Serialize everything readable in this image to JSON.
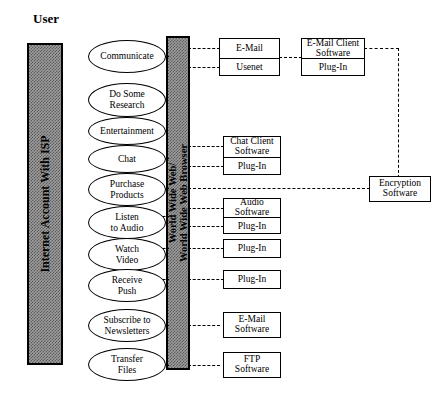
{
  "diagram": {
    "title": "User",
    "bars": [
      {
        "name": "internet-account-bar",
        "label": "Internet Account With ISP"
      },
      {
        "name": "www-browser-bar",
        "label_line1": "World Wide Web/",
        "label_line2": "World Wide Web Browser"
      }
    ],
    "activities": [
      {
        "id": "communicate",
        "label": "Communicate"
      },
      {
        "id": "do-some-research",
        "label": "Do Some\nResearch"
      },
      {
        "id": "entertainment",
        "label": "Entertainment"
      },
      {
        "id": "chat",
        "label": "Chat"
      },
      {
        "id": "purchase-products",
        "label": "Purchase\nProducts"
      },
      {
        "id": "listen-to-audio",
        "label": "Listen\nto Audio"
      },
      {
        "id": "watch-video",
        "label": "Watch\nVideo"
      },
      {
        "id": "receive-push",
        "label": "Receive\nPush"
      },
      {
        "id": "subscribe-to-newsletters",
        "label": "Subscribe to\nNewsletters"
      },
      {
        "id": "transfer-files",
        "label": "Transfer\nFiles"
      }
    ],
    "service_boxes": [
      {
        "id": "email-usenet",
        "cells": [
          "E-Mail",
          "Usenet"
        ]
      },
      {
        "id": "chat-client",
        "cells": [
          "Chat Client\nSoftware",
          "Plug-In"
        ]
      },
      {
        "id": "audio-software",
        "cells": [
          "Audio\nSoftware",
          "Plug-In"
        ]
      },
      {
        "id": "video-plugin",
        "cells": [
          "Plug-In"
        ]
      },
      {
        "id": "push-plugin",
        "cells": [
          "Plug-In"
        ]
      },
      {
        "id": "email-software",
        "cells": [
          "E-Mail\nSoftware"
        ]
      },
      {
        "id": "ftp-software",
        "cells": [
          "FTP\nSoftware"
        ]
      }
    ],
    "client_boxes": [
      {
        "id": "email-client",
        "cells": [
          "E-Mail Client\nSoftware",
          "Plug-In"
        ]
      }
    ],
    "security_boxes": [
      {
        "id": "encryption-software",
        "cells": [
          "Encryption\nSoftware"
        ]
      }
    ]
  }
}
